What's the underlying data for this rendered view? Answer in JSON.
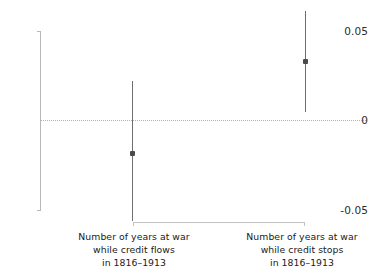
{
  "chart_data": {
    "type": "scatter",
    "title": "",
    "xlabel": "",
    "ylabel": "",
    "ylim": [
      -0.05,
      0.05
    ],
    "yticks": [
      "0.05",
      "0",
      "-0.05"
    ],
    "ytick_values": [
      0.05,
      0,
      -0.05
    ],
    "grid": false,
    "legend": null,
    "zero_reference_line": 0,
    "categories": [
      "Number of years at war while credit flows in 1816–1913",
      "Number of years at war while credit stops in 1816–1913"
    ],
    "points": [
      {
        "label": "Number of years at war while credit flows in 1816–1913",
        "estimate": -0.018,
        "ci_low": -0.056,
        "ci_high": 0.022
      },
      {
        "label": "Number of years at war while credit stops in 1816–1913",
        "estimate": 0.033,
        "ci_low": 0.005,
        "ci_high": 0.061
      }
    ]
  },
  "axis": {
    "y_tick_top": "0.05",
    "y_tick_mid": "0",
    "y_tick_bottom": "-0.05"
  },
  "x_labels": [
    {
      "line1": "Number of years at war",
      "line2": "while credit flows",
      "line3": "in 1816–1913"
    },
    {
      "line1": "Number of years at war",
      "line2": "while credit stops",
      "line3": "in 1816–1913"
    }
  ],
  "colors": {
    "marker": "#4a4a4a",
    "errorbar": "#6e6e6e",
    "axis": "#b8b8b8",
    "zero_line": "#b0b0b0",
    "bracket": "#c2c2c2",
    "text": "#202020",
    "background": "#ffffff"
  }
}
